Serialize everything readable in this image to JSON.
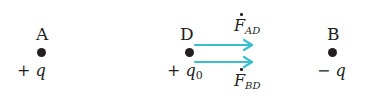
{
  "points": [
    {
      "id": "A",
      "label": "A",
      "charge_sign": "+",
      "charge_symbol": "q",
      "charge_sub": ""
    },
    {
      "id": "D",
      "label": "D",
      "charge_sign": "+",
      "charge_symbol": "q",
      "charge_sub": "0"
    },
    {
      "id": "B",
      "label": "B",
      "charge_sign": "−",
      "charge_symbol": "q",
      "charge_sub": ""
    }
  ],
  "forces": [
    {
      "symbol": "F",
      "sub": "AD"
    },
    {
      "symbol": "F",
      "sub": "BD"
    }
  ],
  "colors": {
    "arrow": "#3bbfcf",
    "ink": "#231f20"
  }
}
